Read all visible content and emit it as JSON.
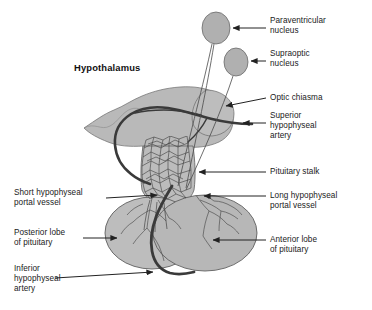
{
  "figure": {
    "title_label": "Hypothalamus",
    "colors": {
      "tissue_fill": "#b9b9b9",
      "tissue_stroke": "#555555",
      "nucleus_fill": "#b0b0b0",
      "artery": "#3a3a3a",
      "leader_line": "#222222",
      "text": "#1a1a1a",
      "background": "#ffffff"
    }
  },
  "labels": {
    "right": [
      {
        "id": "paraventricular-nucleus",
        "text": "Paraventricular\nnucleus"
      },
      {
        "id": "supraoptic-nucleus",
        "text": "Supraoptic\nnucleus"
      },
      {
        "id": "optic-chiasma",
        "text": "Optic chiasma"
      },
      {
        "id": "superior-hypophyseal-artery",
        "text": "Superior\nhypophyseal\nartery"
      },
      {
        "id": "pituitary-stalk",
        "text": "Pituitary stalk"
      },
      {
        "id": "long-hypophyseal-portal-vessel",
        "text": "Long hypophyseal\nportal vessel"
      },
      {
        "id": "anterior-lobe-of-pituitary",
        "text": "Anterior lobe\nof pituitary"
      }
    ],
    "left": [
      {
        "id": "short-hypophyseal-portal-vessel",
        "text": "Short hypophyseal\nportal vessel"
      },
      {
        "id": "posterior-lobe-of-pituitary",
        "text": "Posterior lobe\nof pituitary"
      },
      {
        "id": "inferior-hypophyseal-artery",
        "text": "Inferior\nhypophyseal\nartery"
      }
    ]
  },
  "structures": [
    {
      "id": "paraventricular-nucleus-shape",
      "kind": "ellipse"
    },
    {
      "id": "supraoptic-nucleus-shape",
      "kind": "ellipse"
    },
    {
      "id": "hypothalamus-body-shape",
      "kind": "path"
    },
    {
      "id": "optic-chiasma-shape",
      "kind": "path"
    },
    {
      "id": "pituitary-stalk-shape",
      "kind": "path"
    },
    {
      "id": "posterior-lobe-shape",
      "kind": "ellipse"
    },
    {
      "id": "anterior-lobe-shape",
      "kind": "ellipse"
    },
    {
      "id": "superior-hypophyseal-artery-shape",
      "kind": "path"
    },
    {
      "id": "inferior-hypophyseal-artery-shape",
      "kind": "path"
    },
    {
      "id": "capillary-plexus-shape",
      "kind": "group"
    },
    {
      "id": "portal-vessels-shape",
      "kind": "group"
    }
  ]
}
